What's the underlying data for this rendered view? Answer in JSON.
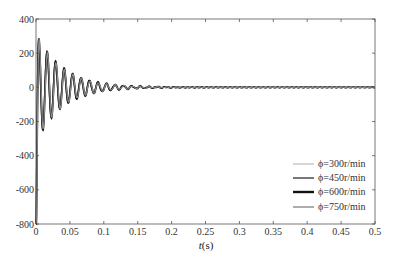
{
  "chart_data": {
    "type": "line",
    "title": "",
    "xlabel": "t(s)",
    "ylabel": "",
    "xlim": [
      0,
      0.5
    ],
    "ylim": [
      -800,
      400
    ],
    "xticks": [
      0,
      0.05,
      0.1,
      0.15,
      0.2,
      0.25,
      0.3,
      0.35,
      0.4,
      0.45,
      0.5
    ],
    "xtick_labels": [
      "0",
      "0.05",
      "0.1",
      "0.15",
      "0.2",
      "0.25",
      "0.3",
      "0.35",
      "0.4",
      "0.45",
      "0.5"
    ],
    "yticks": [
      -800,
      -600,
      -400,
      -200,
      0,
      200,
      400
    ],
    "ytick_labels": [
      "-800",
      "-600",
      "-400",
      "-200",
      "0",
      "200",
      "400"
    ],
    "grid": false,
    "legend_position": "lower right",
    "series": [
      {
        "name": "φ=300r/min",
        "color": "#b0b0b0",
        "width": 1.0,
        "initial": -780,
        "peak": 265,
        "decay": 28,
        "period": 0.0125,
        "phase": 0.0
      },
      {
        "name": "φ=450r/min",
        "color": "#555555",
        "width": 1.4,
        "initial": -790,
        "peak": 268,
        "decay": 27,
        "period": 0.0125,
        "phase": 0.0003
      },
      {
        "name": "φ=600r/min",
        "color": "#111111",
        "width": 1.8,
        "initial": -800,
        "peak": 270,
        "decay": 26,
        "period": 0.0125,
        "phase": 0.0006
      },
      {
        "name": "φ=750r/min",
        "color": "#8a8a8a",
        "width": 1.2,
        "initial": -790,
        "peak": 266,
        "decay": 27,
        "period": 0.0125,
        "phase": 0.0009
      }
    ],
    "sample_points": {
      "t": [
        0,
        0.002,
        0.006,
        0.012,
        0.019,
        0.025,
        0.031,
        0.05,
        0.1,
        0.2,
        0.5
      ],
      "approx_value": [
        -800,
        -300,
        270,
        -230,
        175,
        -150,
        120,
        60,
        20,
        5,
        0
      ]
    }
  },
  "legend": {
    "items": [
      {
        "label": "ϕ=300r/min",
        "color": "#b0b0b0",
        "width": 1.0
      },
      {
        "label": "ϕ=450r/min",
        "color": "#555555",
        "width": 1.6
      },
      {
        "label": "ϕ=600r/min",
        "color": "#111111",
        "width": 2.4
      },
      {
        "label": "ϕ=750r/min",
        "color": "#8a8a8a",
        "width": 1.4
      }
    ]
  },
  "axes": {
    "x_label_italic": "t",
    "x_label_unit": "(s)"
  }
}
